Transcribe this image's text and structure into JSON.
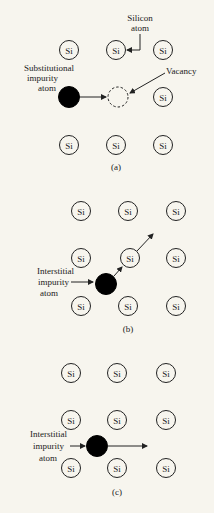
{
  "figure": {
    "atom_symbol": "Si",
    "colors": {
      "background": "#f7f5ee",
      "ink": "#222222",
      "impurity": "#000000"
    },
    "panels": [
      {
        "id": "a",
        "caption": "(a)",
        "labels": {
          "silicon_atom_line1": "Silicon",
          "silicon_atom_line2": "atom",
          "vacancy": "Vacancy",
          "impurity_line1": "Substitutional",
          "impurity_line2": "impurity",
          "impurity_line3": "atom"
        }
      },
      {
        "id": "b",
        "caption": "(b)",
        "labels": {
          "impurity_line1": "Interstitial",
          "impurity_line2": "impurity",
          "impurity_line3": "atom"
        }
      },
      {
        "id": "c",
        "caption": "(c)",
        "labels": {
          "impurity_line1": "Interstitial",
          "impurity_line2": "impurity",
          "impurity_line3": "atom"
        }
      }
    ]
  }
}
